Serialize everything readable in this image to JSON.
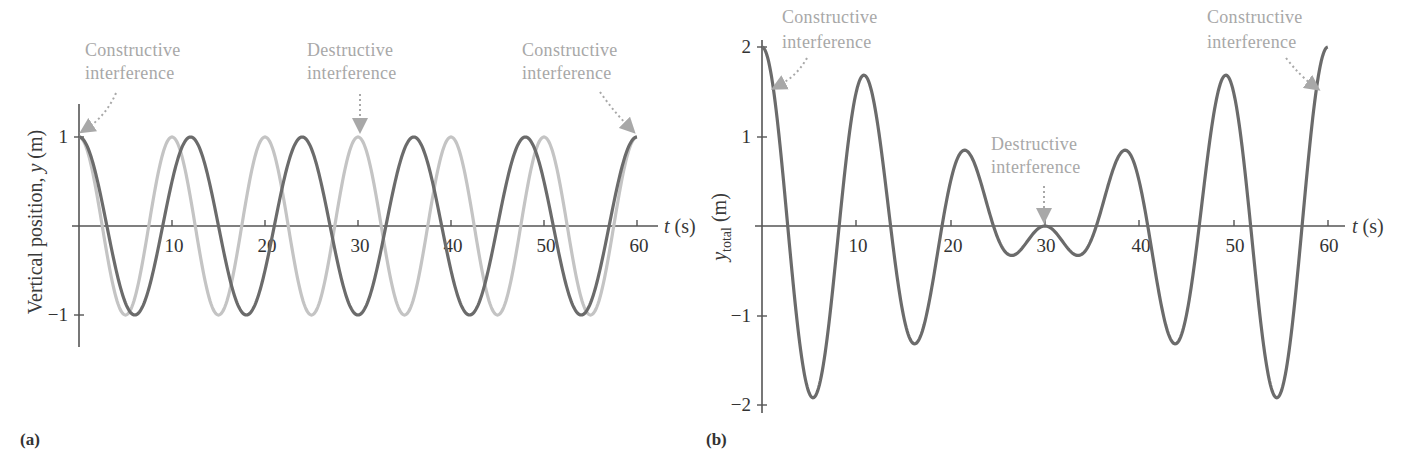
{
  "panels": {
    "a": {
      "label": "(a)",
      "ylabel": "Vertical position, y (m)",
      "ylabel_prefix": "Vertical position, ",
      "ylabel_var": "y",
      "ylabel_unit": " (m)",
      "xlabel_var": "t",
      "xlabel_unit": " (s)",
      "x_ticks": [
        "10",
        "20",
        "30",
        "40",
        "50",
        "60"
      ],
      "y_ticks": [
        "1",
        "−1"
      ],
      "annotations": [
        {
          "line1": "Constructive",
          "line2": "interference"
        },
        {
          "line1": "Destructive",
          "line2": "interference"
        },
        {
          "line1": "Constructive",
          "line2": "interference"
        }
      ]
    },
    "b": {
      "label": "(b)",
      "ylabel_var": "y",
      "ylabel_sub": "total",
      "ylabel_unit": " (m)",
      "xlabel_var": "t",
      "xlabel_unit": " (s)",
      "x_ticks": [
        "10",
        "20",
        "30",
        "40",
        "50",
        "60"
      ],
      "y_ticks": [
        "2",
        "1",
        "−1",
        "−2"
      ],
      "annotations": [
        {
          "line1": "Constructive",
          "line2": "interference"
        },
        {
          "line1": "Destructive",
          "line2": "interference"
        },
        {
          "line1": "Constructive",
          "line2": "interference"
        }
      ]
    }
  },
  "colors": {
    "wave1": "#c4c4c4",
    "wave2": "#6b6b6b",
    "sum": "#6b6b6b",
    "axis": "#555555",
    "annotation": "#a8a8a8"
  },
  "chart_data": [
    {
      "type": "line",
      "title": "(a)",
      "xlabel": "t (s)",
      "ylabel": "Vertical position, y (m)",
      "xlim": [
        0,
        60
      ],
      "ylim": [
        -1,
        1
      ],
      "x_ticks": [
        10,
        20,
        30,
        40,
        50,
        60
      ],
      "y_ticks": [
        -1,
        1
      ],
      "grid": false,
      "series": [
        {
          "name": "wave 1 (period 10 s)",
          "color": "#c4c4c4",
          "formula": "cos(2*pi*t/10)",
          "x": [
            0,
            5,
            10,
            15,
            20,
            25,
            30,
            35,
            40,
            45,
            50,
            55,
            60
          ],
          "values": [
            1,
            -1,
            1,
            -1,
            1,
            -1,
            1,
            -1,
            1,
            -1,
            1,
            -1,
            1
          ]
        },
        {
          "name": "wave 2 (period 12 s)",
          "color": "#6b6b6b",
          "formula": "cos(2*pi*t/12)",
          "x": [
            0,
            6,
            12,
            18,
            24,
            30,
            36,
            42,
            48,
            54,
            60
          ],
          "values": [
            1,
            -1,
            1,
            -1,
            1,
            -1,
            1,
            -1,
            1,
            -1,
            1
          ]
        }
      ],
      "annotations": [
        {
          "text": "Constructive interference",
          "x": 0,
          "y": 1
        },
        {
          "text": "Destructive interference",
          "x": 30,
          "y": 1
        },
        {
          "text": "Constructive interference",
          "x": 60,
          "y": 1
        }
      ]
    },
    {
      "type": "line",
      "title": "(b)",
      "xlabel": "t (s)",
      "ylabel": "y_total (m)",
      "xlim": [
        0,
        60
      ],
      "ylim": [
        -2,
        2
      ],
      "x_ticks": [
        10,
        20,
        30,
        40,
        50,
        60
      ],
      "y_ticks": [
        -2,
        -1,
        1,
        2
      ],
      "grid": false,
      "series": [
        {
          "name": "y_total = sum of waves",
          "color": "#6b6b6b",
          "formula": "cos(2*pi*t/10)+cos(2*pi*t/12)",
          "x": [
            0,
            4.5,
            10.5,
            15.5,
            21,
            25.5,
            30,
            34.5,
            39,
            44.5,
            49.5,
            55.5,
            60
          ],
          "values": [
            2,
            -1.9,
            1.65,
            -1.3,
            0.8,
            -0.38,
            0,
            -0.38,
            0.8,
            -1.3,
            1.65,
            -1.9,
            2
          ]
        }
      ],
      "annotations": [
        {
          "text": "Constructive interference",
          "x": 0,
          "y": 2
        },
        {
          "text": "Destructive interference",
          "x": 30,
          "y": 0
        },
        {
          "text": "Constructive interference",
          "x": 60,
          "y": 2
        }
      ]
    }
  ]
}
